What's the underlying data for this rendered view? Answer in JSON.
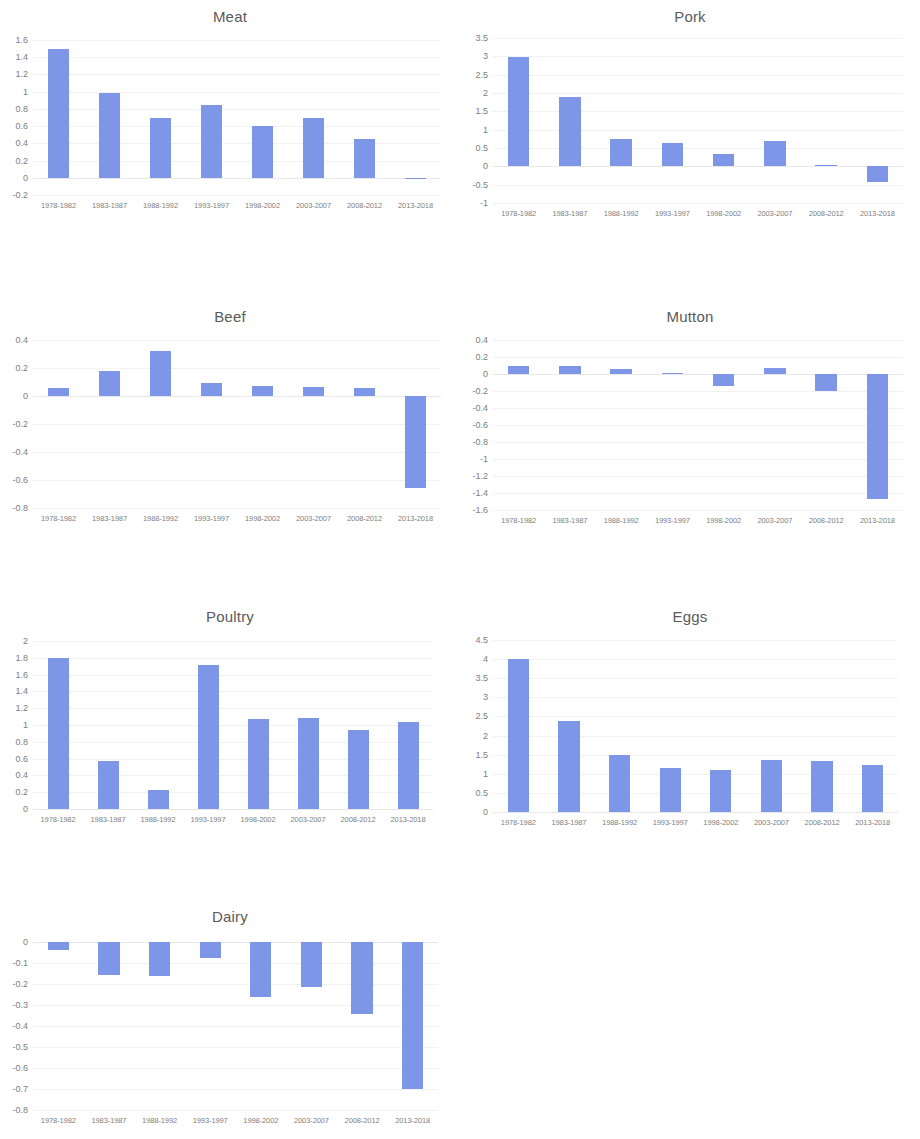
{
  "figure": {
    "kind": "small-multiples-bar-grid",
    "columns": 2,
    "bar_color": "#7e96e8",
    "gridline_color": "#f2f2f2",
    "axis_text_color": "#7d7d7d",
    "title_color": "#5a5a5a",
    "background": "#ffffff"
  },
  "categories": [
    "1978-1982",
    "1983-1987",
    "1988-1992",
    "1993-1997",
    "1998-2002",
    "2003-2007",
    "2008-2012",
    "2013-2018"
  ],
  "chart_data": [
    {
      "type": "bar",
      "title": "Meat",
      "xlabel": "",
      "ylabel": "",
      "categories": [
        "1978-1982",
        "1983-1987",
        "1988-1992",
        "1993-1997",
        "1998-2002",
        "2003-2007",
        "2008-2012",
        "2013-2018"
      ],
      "values": [
        1.49,
        0.99,
        0.69,
        0.85,
        0.6,
        0.69,
        0.45,
        -0.01
      ],
      "ylim": [
        -0.2,
        1.6
      ],
      "yticks": [
        1.6,
        1.4,
        1.2,
        1,
        0.8,
        0.6,
        0.4,
        0.2,
        0,
        -0.2
      ],
      "ytick_labels": [
        "1.6",
        "1.4",
        "1.2",
        "1",
        "0.8",
        "0.6",
        "0.4",
        "0.2",
        "0",
        "-0.2"
      ],
      "grid": true,
      "legend": "none"
    },
    {
      "type": "bar",
      "title": "Pork",
      "xlabel": "",
      "ylabel": "",
      "categories": [
        "1978-1982",
        "1983-1987",
        "1988-1992",
        "1993-1997",
        "1998-2002",
        "2003-2007",
        "2008-2012",
        "2013-2018"
      ],
      "values": [
        2.98,
        1.88,
        0.75,
        0.63,
        0.34,
        0.68,
        0.03,
        -0.42
      ],
      "ylim": [
        -1,
        3.5
      ],
      "yticks": [
        3.5,
        3,
        2.5,
        2,
        1.5,
        1,
        0.5,
        0,
        -0.5,
        -1
      ],
      "ytick_labels": [
        "3.5",
        "3",
        "2.5",
        "2",
        "1.5",
        "1",
        "0.5",
        "0",
        "-0.5",
        "-1"
      ],
      "grid": true,
      "legend": "none"
    },
    {
      "type": "bar",
      "title": "Beef",
      "xlabel": "",
      "ylabel": "",
      "categories": [
        "1978-1982",
        "1983-1987",
        "1988-1992",
        "1993-1997",
        "1998-2002",
        "2003-2007",
        "2008-2012",
        "2013-2018"
      ],
      "values": [
        0.06,
        0.18,
        0.32,
        0.09,
        0.07,
        0.065,
        0.06,
        -0.66
      ],
      "ylim": [
        -0.8,
        0.4
      ],
      "yticks": [
        0.4,
        0.2,
        0,
        -0.2,
        -0.4,
        -0.6,
        -0.8
      ],
      "ytick_labels": [
        "0.4",
        "0.2",
        "0",
        "-0.2",
        "-0.4",
        "-0.6",
        "-0.8"
      ],
      "grid": true,
      "legend": "none"
    },
    {
      "type": "bar",
      "title": "Mutton",
      "xlabel": "",
      "ylabel": "",
      "categories": [
        "1978-1982",
        "1983-1987",
        "1988-1992",
        "1993-1997",
        "1998-2002",
        "2003-2007",
        "2008-2012",
        "2013-2018"
      ],
      "values": [
        0.1,
        0.09,
        0.06,
        0.01,
        -0.14,
        0.07,
        -0.2,
        -1.47
      ],
      "ylim": [
        -1.6,
        0.4
      ],
      "yticks": [
        0.4,
        0.2,
        0,
        -0.2,
        -0.4,
        -0.6,
        -0.8,
        -1,
        -1.2,
        -1.4,
        -1.6
      ],
      "ytick_labels": [
        "0.4",
        "0.2",
        "0",
        "-0.2",
        "-0.4",
        "-0.6",
        "-0.8",
        "-1",
        "-1.2",
        "-1.4",
        "-1.6"
      ],
      "grid": true,
      "legend": "none"
    },
    {
      "type": "bar",
      "title": "Poultry",
      "xlabel": "",
      "ylabel": "",
      "categories": [
        "1978-1982",
        "1983-1987",
        "1988-1992",
        "1993-1997",
        "1998-2002",
        "2003-2007",
        "2008-2012",
        "2013-2018"
      ],
      "values": [
        1.8,
        0.57,
        0.23,
        1.72,
        1.07,
        1.08,
        0.94,
        1.04
      ],
      "ylim": [
        0,
        2
      ],
      "yticks": [
        2,
        1.8,
        1.6,
        1.4,
        1.2,
        1,
        0.8,
        0.6,
        0.4,
        0.2,
        0
      ],
      "ytick_labels": [
        "2",
        "1.8",
        "1.6",
        "1.4",
        "1.2",
        "1",
        "0.8",
        "0.6",
        "0.4",
        "0.2",
        "0"
      ],
      "grid": true,
      "legend": "none"
    },
    {
      "type": "bar",
      "title": "Eggs",
      "xlabel": "",
      "ylabel": "",
      "categories": [
        "1978-1982",
        "1983-1987",
        "1988-1992",
        "1993-1997",
        "1998-2002",
        "2003-2007",
        "2008-2012",
        "2013-2018"
      ],
      "values": [
        4.0,
        2.37,
        1.48,
        1.16,
        1.11,
        1.35,
        1.34,
        1.22
      ],
      "ylim": [
        0,
        4.5
      ],
      "yticks": [
        4.5,
        4,
        3.5,
        3,
        2.5,
        2,
        1.5,
        1,
        0.5,
        0
      ],
      "ytick_labels": [
        "4.5",
        "4",
        "3.5",
        "3",
        "2.5",
        "2",
        "1.5",
        "1",
        "0.5",
        "0"
      ],
      "grid": true,
      "legend": "none"
    },
    {
      "type": "bar",
      "title": "Dairy",
      "xlabel": "",
      "ylabel": "",
      "categories": [
        "1978-1982",
        "1983-1987",
        "1988-1992",
        "1993-1997",
        "1998-2002",
        "2003-2007",
        "2008-2012",
        "2013-2018"
      ],
      "values": [
        -0.04,
        -0.155,
        -0.16,
        -0.075,
        -0.26,
        -0.215,
        -0.345,
        -0.7
      ],
      "ylim": [
        -0.8,
        0
      ],
      "yticks": [
        0,
        -0.1,
        -0.2,
        -0.3,
        -0.4,
        -0.5,
        -0.6,
        -0.7,
        -0.8
      ],
      "ytick_labels": [
        "0",
        "-0.1",
        "-0.2",
        "-0.3",
        "-0.4",
        "-0.5",
        "-0.6",
        "-0.7",
        "-0.8"
      ],
      "grid": true,
      "legend": "none"
    }
  ]
}
